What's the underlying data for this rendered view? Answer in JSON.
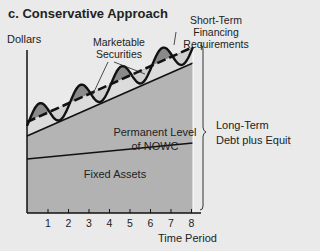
{
  "title": "c. Conservative Approach",
  "y_axis_label": "Dollars",
  "x_axis_label": "Time Period",
  "x_ticks": [
    "1",
    "2",
    "3",
    "4",
    "5",
    "6",
    "7",
    "8"
  ],
  "labels": {
    "marketable_securities": "Marketable Securities",
    "short_term_financing": "Short-Term Financing Requirements",
    "permanent_nowc_line1": "Permanent Level",
    "permanent_nowc_line2": "of NOWC",
    "fixed_assets": "Fixed Assets",
    "long_term_line1": "Long-Term",
    "long_term_line2": "Debt plus Equity"
  },
  "colors": {
    "background": "#eaeaea",
    "fixed_assets_fill": "#b4b4b4",
    "nowc_fill": "#b4b4b4",
    "seasonal_band_fill": "#dcdcdc",
    "financing_gap_fill": "#8a8a8a",
    "line": "#111111"
  }
}
